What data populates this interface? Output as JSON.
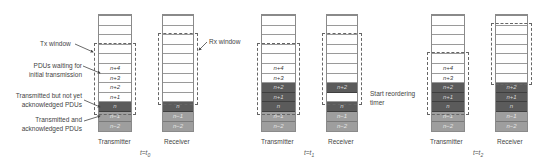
{
  "annotations": {
    "tx_window": "Tx window",
    "pdus_waiting_1": "PDUs waiting for",
    "pdus_waiting_2": "initial transmission",
    "transmitted_not_acked_1": "Transmitted but not yet",
    "transmitted_not_acked_2": "acknowledged PDUs",
    "transmitted_acked_1": "Transmitted and",
    "transmitted_acked_2": "acknowledged PDUs",
    "rx_window": "Rx window",
    "reordering_1": "Start reordering",
    "reordering_2": "timer"
  },
  "panels": [
    {
      "time_prefix": "t=t",
      "time_sub": "0",
      "transmitter": {
        "label": "Transmitter",
        "cells": [
          {
            "text": "",
            "style": "empty"
          },
          {
            "text": "",
            "style": "empty"
          },
          {
            "text": "",
            "style": "empty"
          },
          {
            "text": "",
            "style": "empty"
          },
          {
            "text": "",
            "style": "empty"
          },
          {
            "text": "n+4",
            "style": "empty"
          },
          {
            "text": "n+3",
            "style": "empty"
          },
          {
            "text": "n+2",
            "style": "empty"
          },
          {
            "text": "n+1",
            "style": "empty"
          },
          {
            "text": "n",
            "style": "dark"
          },
          {
            "text": "n−1",
            "style": "grey"
          },
          {
            "text": "n−2",
            "style": "grey"
          }
        ]
      },
      "receiver": {
        "label": "Receiver",
        "cells": [
          {
            "text": "",
            "style": "empty"
          },
          {
            "text": "",
            "style": "empty"
          },
          {
            "text": "",
            "style": "empty"
          },
          {
            "text": "",
            "style": "empty"
          },
          {
            "text": "",
            "style": "empty"
          },
          {
            "text": "",
            "style": "empty"
          },
          {
            "text": "",
            "style": "empty"
          },
          {
            "text": "",
            "style": "empty"
          },
          {
            "text": "",
            "style": "empty"
          },
          {
            "text": "n",
            "style": "dark"
          },
          {
            "text": "n−1",
            "style": "grey"
          },
          {
            "text": "n−2",
            "style": "grey"
          }
        ]
      }
    },
    {
      "time_prefix": "t=t",
      "time_sub": "1",
      "transmitter": {
        "label": "Transmitter",
        "cells": [
          {
            "text": "",
            "style": "empty"
          },
          {
            "text": "",
            "style": "empty"
          },
          {
            "text": "",
            "style": "empty"
          },
          {
            "text": "",
            "style": "empty"
          },
          {
            "text": "",
            "style": "empty"
          },
          {
            "text": "n+4",
            "style": "empty"
          },
          {
            "text": "n+3",
            "style": "empty"
          },
          {
            "text": "n+2",
            "style": "dark"
          },
          {
            "text": "n+1",
            "style": "dark"
          },
          {
            "text": "n",
            "style": "dark"
          },
          {
            "text": "n−1",
            "style": "grey"
          },
          {
            "text": "n−2",
            "style": "grey"
          }
        ]
      },
      "receiver": {
        "label": "Receiver",
        "cells": [
          {
            "text": "",
            "style": "empty"
          },
          {
            "text": "",
            "style": "empty"
          },
          {
            "text": "",
            "style": "empty"
          },
          {
            "text": "",
            "style": "empty"
          },
          {
            "text": "",
            "style": "empty"
          },
          {
            "text": "",
            "style": "empty"
          },
          {
            "text": "",
            "style": "empty"
          },
          {
            "text": "n+2",
            "style": "dark"
          },
          {
            "text": "",
            "style": "empty"
          },
          {
            "text": "n",
            "style": "dark"
          },
          {
            "text": "n−1",
            "style": "grey"
          },
          {
            "text": "n−2",
            "style": "grey"
          }
        ]
      }
    },
    {
      "time_prefix": "t=t",
      "time_sub": "2",
      "transmitter": {
        "label": "Transmitter",
        "cells": [
          {
            "text": "",
            "style": "empty"
          },
          {
            "text": "",
            "style": "empty"
          },
          {
            "text": "",
            "style": "empty"
          },
          {
            "text": "",
            "style": "empty"
          },
          {
            "text": "",
            "style": "empty"
          },
          {
            "text": "n+4",
            "style": "empty"
          },
          {
            "text": "n+3",
            "style": "empty"
          },
          {
            "text": "n+2",
            "style": "dark"
          },
          {
            "text": "n+1",
            "style": "dark"
          },
          {
            "text": "n",
            "style": "dark"
          },
          {
            "text": "n−1",
            "style": "grey"
          },
          {
            "text": "n−2",
            "style": "grey"
          }
        ]
      },
      "receiver": {
        "label": "Receiver",
        "cells": [
          {
            "text": "",
            "style": "empty"
          },
          {
            "text": "",
            "style": "empty"
          },
          {
            "text": "",
            "style": "empty"
          },
          {
            "text": "",
            "style": "empty"
          },
          {
            "text": "",
            "style": "empty"
          },
          {
            "text": "",
            "style": "empty"
          },
          {
            "text": "",
            "style": "empty"
          },
          {
            "text": "n+2",
            "style": "dark"
          },
          {
            "text": "n+1",
            "style": "dark"
          },
          {
            "text": "n",
            "style": "dark"
          },
          {
            "text": "n−1",
            "style": "grey"
          },
          {
            "text": "n−2",
            "style": "grey"
          }
        ]
      }
    }
  ],
  "colors": {
    "dark_cell": "#5b5b5b",
    "grey_cell": "#9e9e9e",
    "border": "#8a8a8a"
  }
}
